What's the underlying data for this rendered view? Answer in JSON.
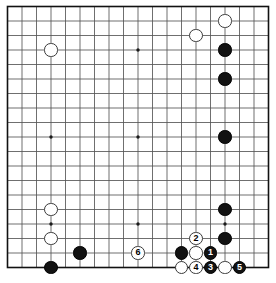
{
  "board": {
    "type": "go-board",
    "size": 19,
    "grid": {
      "left": 7.5,
      "top": 6.5,
      "spacing": 14.5,
      "lines": 19,
      "line_color": "#555555",
      "border_color": "#111111",
      "background": "#ffffff"
    },
    "star_points": [
      {
        "col": 3,
        "row": 3
      },
      {
        "col": 9,
        "row": 3
      },
      {
        "col": 15,
        "row": 3
      },
      {
        "col": 3,
        "row": 9
      },
      {
        "col": 9,
        "row": 9
      },
      {
        "col": 15,
        "row": 9
      },
      {
        "col": 3,
        "row": 15
      },
      {
        "col": 9,
        "row": 15
      },
      {
        "col": 15,
        "row": 15
      }
    ],
    "stone_radius": 6.6,
    "colors": {
      "black": "#121212",
      "white": "#ffffff",
      "black_label": "#ffffff",
      "white_label": "#000000"
    },
    "stones": [
      {
        "id": "w-q17",
        "color": "white",
        "col": 15,
        "row": 1,
        "label": ""
      },
      {
        "id": "w-o16",
        "color": "white",
        "col": 13,
        "row": 2,
        "label": ""
      },
      {
        "id": "w-d16",
        "color": "white",
        "col": 3,
        "row": 3,
        "label": ""
      },
      {
        "id": "b-q16",
        "color": "black",
        "col": 15,
        "row": 3,
        "label": ""
      },
      {
        "id": "b-q15",
        "color": "black",
        "col": 15,
        "row": 5,
        "label": ""
      },
      {
        "id": "b-q10",
        "color": "black",
        "col": 15,
        "row": 9,
        "label": ""
      },
      {
        "id": "w-d6",
        "color": "white",
        "col": 3,
        "row": 14,
        "label": ""
      },
      {
        "id": "b-q6",
        "color": "black",
        "col": 15,
        "row": 14,
        "label": ""
      },
      {
        "id": "w-d5",
        "color": "white",
        "col": 3,
        "row": 16,
        "label": ""
      },
      {
        "id": "b-q5",
        "color": "black",
        "col": 15,
        "row": 16,
        "label": ""
      },
      {
        "id": "w-move-2",
        "color": "white",
        "col": 13,
        "row": 16,
        "label": "2"
      },
      {
        "id": "b-f3",
        "color": "black",
        "col": 5,
        "row": 17,
        "label": ""
      },
      {
        "id": "w-move-6",
        "color": "white",
        "col": 9,
        "row": 17,
        "label": "6"
      },
      {
        "id": "b-n3",
        "color": "black",
        "col": 12,
        "row": 17,
        "label": ""
      },
      {
        "id": "w-o3",
        "color": "white",
        "col": 13,
        "row": 17,
        "label": ""
      },
      {
        "id": "b-move-1",
        "color": "black",
        "col": 14,
        "row": 17,
        "label": "1"
      },
      {
        "id": "b-c2",
        "color": "black",
        "col": 3,
        "row": 18,
        "label": ""
      },
      {
        "id": "w-n2",
        "color": "white",
        "col": 12,
        "row": 18,
        "label": ""
      },
      {
        "id": "w-move-4",
        "color": "white",
        "col": 13,
        "row": 18,
        "label": "4"
      },
      {
        "id": "b-move-3",
        "color": "black",
        "col": 14,
        "row": 18,
        "label": "3"
      },
      {
        "id": "w-q2",
        "color": "white",
        "col": 15,
        "row": 18,
        "label": ""
      },
      {
        "id": "b-move-5",
        "color": "black",
        "col": 16,
        "row": 18,
        "label": "5"
      }
    ],
    "move_sequence": [
      {
        "number": "1",
        "color": "black"
      },
      {
        "number": "2",
        "color": "white"
      },
      {
        "number": "3",
        "color": "black"
      },
      {
        "number": "4",
        "color": "white"
      },
      {
        "number": "5",
        "color": "black"
      },
      {
        "number": "6",
        "color": "white"
      }
    ]
  }
}
